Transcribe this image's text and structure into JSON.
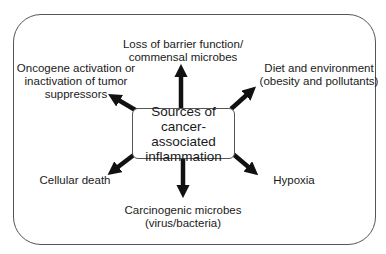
{
  "diagram": {
    "center": {
      "lines": [
        "Sources of",
        "cancer-associated",
        "inflammation"
      ]
    },
    "sources": [
      {
        "id": "barrier",
        "lines": [
          "Loss of barrier function/",
          "commensal microbes"
        ],
        "direction": "up"
      },
      {
        "id": "oncogene",
        "lines": [
          "Oncogene activation or",
          "inactivation of tumor",
          "suppressors"
        ],
        "direction": "up-left"
      },
      {
        "id": "diet",
        "lines": [
          "Diet and environment",
          "(obesity and pollutants)"
        ],
        "direction": "up-right"
      },
      {
        "id": "cell-death",
        "lines": [
          "Cellular death"
        ],
        "direction": "down-left"
      },
      {
        "id": "microbes",
        "lines": [
          "Carcinogenic microbes",
          "(virus/bacteria)"
        ],
        "direction": "down"
      },
      {
        "id": "hypoxia",
        "lines": [
          "Hypoxia"
        ],
        "direction": "down-right"
      }
    ]
  }
}
